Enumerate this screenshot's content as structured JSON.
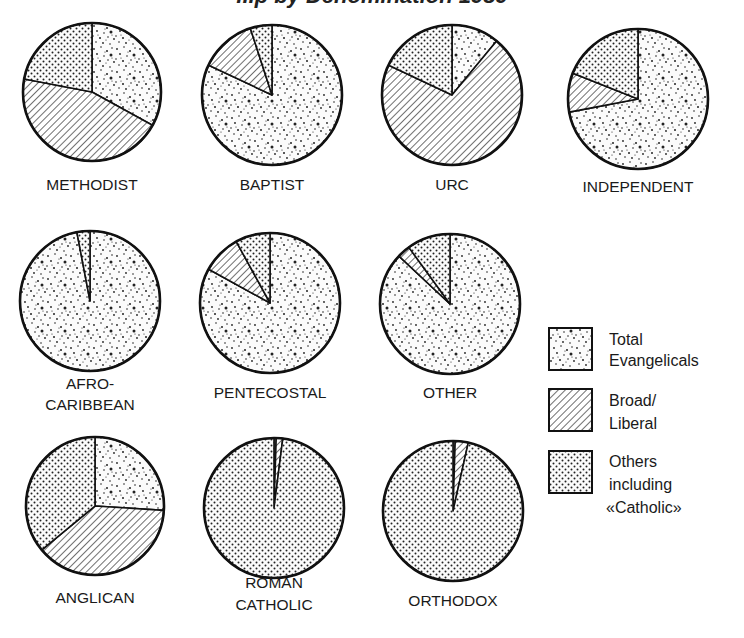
{
  "chart_data": {
    "type": "pie",
    "title": "...p by Denomination 1989",
    "title_note": "Title is mostly cropped at top edge of image",
    "legend": [
      {
        "key": "evangelical",
        "label_lines": [
          "Total",
          "Evangelicals"
        ],
        "pattern": "random-speckle"
      },
      {
        "key": "broad",
        "label_lines": [
          "Broad/",
          "Liberal"
        ],
        "pattern": "diagonal-hatch"
      },
      {
        "key": "others",
        "label_lines": [
          "Others",
          "including",
          "«Catholic»"
        ],
        "pattern": "regular-dot-grid"
      }
    ],
    "legend_position": "right",
    "series_order": [
      "Total Evangelicals",
      "Broad/Liberal",
      "Others including «Catholic»"
    ],
    "units": "percent (estimated from slice angles)",
    "pies": [
      {
        "name": "Methodist",
        "label_lines": [
          "METHODIST"
        ],
        "values": {
          "evangelical": 33,
          "broad": 45,
          "others": 22
        },
        "cx": 92,
        "cy": 92,
        "r": 69,
        "label_y": [
          190
        ]
      },
      {
        "name": "Baptist",
        "label_lines": [
          "BAPTIST"
        ],
        "values": {
          "evangelical": 82,
          "broad": 13,
          "others": 5
        },
        "cx": 272,
        "cy": 95,
        "r": 70,
        "label_y": [
          190
        ]
      },
      {
        "name": "URC",
        "label_lines": [
          "URC"
        ],
        "values": {
          "evangelical": 11,
          "broad": 71,
          "others": 18
        },
        "cx": 452,
        "cy": 95,
        "r": 70,
        "label_y": [
          190
        ]
      },
      {
        "name": "Independent",
        "label_lines": [
          "INDEPENDENT"
        ],
        "values": {
          "evangelical": 72,
          "broad": 9,
          "others": 19
        },
        "cx": 638,
        "cy": 99,
        "r": 70,
        "label_y": [
          192
        ]
      },
      {
        "name": "Afro-Caribbean",
        "label_lines": [
          "AFRO-",
          "CARIBBEAN"
        ],
        "values": {
          "evangelical": 97,
          "broad": 0,
          "others": 3
        },
        "cx": 90,
        "cy": 301,
        "r": 70,
        "label_y": [
          389,
          410
        ]
      },
      {
        "name": "Pentecostal",
        "label_lines": [
          "PENTECOSTAL"
        ],
        "values": {
          "evangelical": 83,
          "broad": 9,
          "others": 8
        },
        "cx": 270,
        "cy": 303,
        "r": 70,
        "label_y": [
          398
        ]
      },
      {
        "name": "Other",
        "label_lines": [
          "OTHER"
        ],
        "values": {
          "evangelical": 87,
          "broad": 3,
          "others": 10
        },
        "cx": 450,
        "cy": 304,
        "r": 70,
        "label_y": [
          398
        ]
      },
      {
        "name": "Anglican",
        "label_lines": [
          "ANGLICAN"
        ],
        "values": {
          "evangelical": 26,
          "broad": 38,
          "others": 36
        },
        "cx": 95,
        "cy": 506,
        "r": 69,
        "label_y": [
          603
        ]
      },
      {
        "name": "Roman Catholic",
        "label_lines": [
          "ROMAN",
          "CATHOLIC"
        ],
        "values": {
          "evangelical": 0.5,
          "broad": 1.5,
          "others": 98
        },
        "cx": 274,
        "cy": 508,
        "r": 70,
        "label_y": [
          588,
          610
        ]
      },
      {
        "name": "Orthodox",
        "label_lines": [
          "ORTHODOX"
        ],
        "values": {
          "evangelical": 0.5,
          "broad": 3,
          "others": 96.5
        },
        "cx": 453,
        "cy": 511,
        "r": 70,
        "label_y": [
          606
        ]
      }
    ]
  }
}
